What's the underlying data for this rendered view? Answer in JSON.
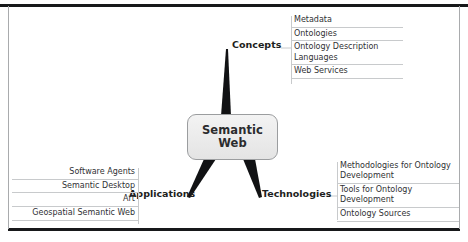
{
  "diagram": {
    "type": "mind-map",
    "center": {
      "line1": "Semantic",
      "line2": "Web"
    },
    "branches": [
      {
        "id": "concepts",
        "label": "Concepts",
        "position": "top-right",
        "items": [
          "Metadata",
          "Ontologies",
          "Ontology Description\nLanguages",
          "Web Services"
        ]
      },
      {
        "id": "technologies",
        "label": "Technologies",
        "position": "bottom-right",
        "items": [
          "Methodologies for Ontology\nDevelopment",
          "Tools for Ontology\nDevelopment",
          "Ontology Sources"
        ]
      },
      {
        "id": "applications",
        "label": "Applications",
        "position": "bottom-left",
        "items": [
          "Software Agents",
          "Semantic Desktop",
          "Art",
          "Geospatial Semantic Web"
        ]
      }
    ],
    "colors": {
      "branch": "#111214",
      "node_border": "#9b9d9f",
      "node_fill": "#ededed",
      "connector": "#c8cacc",
      "frame": "#17181a",
      "text": "#2b2c2e"
    }
  }
}
